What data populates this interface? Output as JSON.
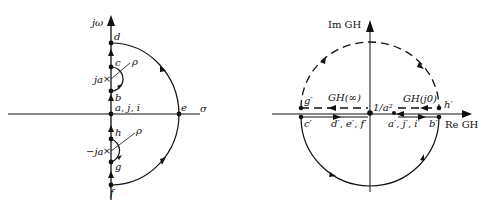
{
  "left": {
    "title": "s-plane Nyquist contour",
    "axis_y_label": "jω",
    "axis_x_label": "σ",
    "points": {
      "d": "d",
      "c": "c",
      "ja": "ja",
      "b": "b",
      "aji": "a, j, i",
      "e": "e",
      "h": "h",
      "neg_ja": "−ja",
      "g": "g",
      "f": "f",
      "rho_top": "ρ",
      "rho_bottom": "ρ"
    }
  },
  "right": {
    "title": "GH-plane Nyquist plot",
    "axis_y_label": "Im GH",
    "axis_x_label": "Re GH",
    "labels": {
      "g_prime": "g′",
      "gh_inf": "GH(∞)",
      "one_over_a2": "1/a²",
      "gh_j0": "GH(j0)",
      "h_prime": "h′",
      "c_prime": "c′",
      "def_prime": "d′, e′, f′",
      "aji_prime": "a′, j′, i′",
      "b_prime": "b′"
    }
  },
  "colors": {
    "stroke": "#111111",
    "background": "#ffffff"
  }
}
